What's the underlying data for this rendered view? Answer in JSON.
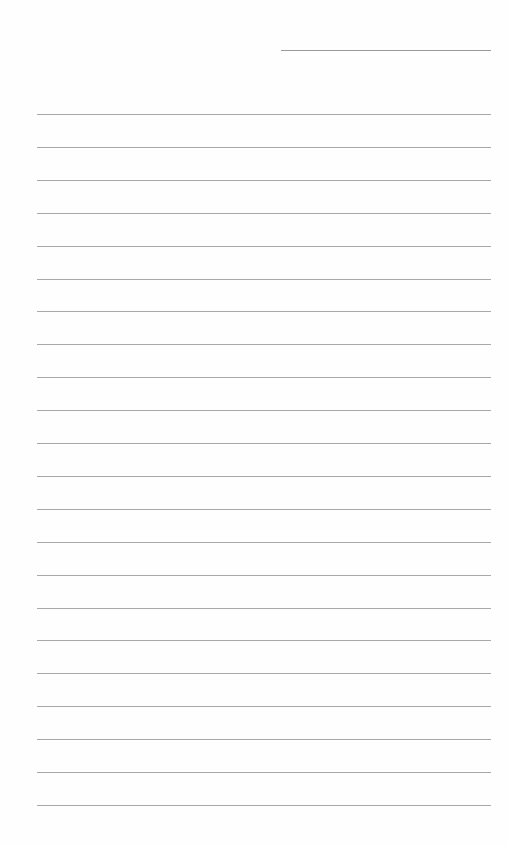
{
  "page": {
    "type": "lined-paper",
    "background_color": "#fefefe",
    "line_color": "#a8a8a8",
    "header_line": {
      "left": 281,
      "top": 50,
      "width": 210
    },
    "rules": {
      "count": 22,
      "first_top": 114,
      "spacing": 32.9,
      "left": 37,
      "width": 454
    }
  }
}
